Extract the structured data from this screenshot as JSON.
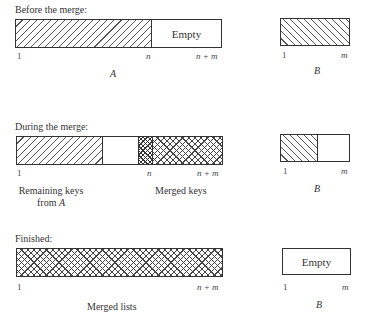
{
  "diagram": {
    "type": "array-merge-illustration",
    "stages": [
      {
        "id": "before",
        "caption": "Before the merge:",
        "array_a": {
          "name": "A",
          "segments": [
            {
              "kind": "keys-of-A",
              "pattern": "forward-hatch",
              "from": "1",
              "to": "n"
            },
            {
              "kind": "empty",
              "label": "Empty",
              "from": "n",
              "to": "n+m"
            }
          ],
          "ticks": {
            "start": "1",
            "mid": "n",
            "end": "n + m"
          }
        },
        "array_b": {
          "name": "B",
          "segments": [
            {
              "kind": "keys-of-B",
              "pattern": "back-hatch",
              "from": "1",
              "to": "m"
            }
          ],
          "ticks": {
            "start": "1",
            "end": "m"
          }
        }
      },
      {
        "id": "during",
        "caption": "During the merge:",
        "array_a": {
          "segments": [
            {
              "kind": "remaining-keys-of-A",
              "pattern": "forward-hatch"
            },
            {
              "kind": "gap",
              "pattern": "none"
            },
            {
              "kind": "merged-keys",
              "pattern": "dense-crosshatch"
            },
            {
              "kind": "merged-keys",
              "pattern": "crosshatch"
            }
          ],
          "ticks": {
            "start": "1",
            "mid": "n",
            "end": "n + m"
          },
          "annotations": {
            "left_line1": "Remaining keys",
            "left_line2_prefix": "from ",
            "left_line2_var": "A",
            "right": "Merged keys"
          }
        },
        "array_b": {
          "name": "B",
          "segments": [
            {
              "kind": "remaining-keys-of-B",
              "pattern": "back-hatch"
            },
            {
              "kind": "empty",
              "pattern": "none"
            }
          ],
          "ticks": {
            "start": "1",
            "end": "m"
          }
        }
      },
      {
        "id": "finished",
        "caption": "Finished:",
        "array_a": {
          "segments": [
            {
              "kind": "merged-lists",
              "pattern": "crosshatch",
              "from": "1",
              "to": "n+m"
            }
          ],
          "ticks": {
            "start": "1",
            "end": "n + m"
          },
          "annotation": "Merged lists"
        },
        "array_b": {
          "name": "B",
          "segments": [
            {
              "kind": "empty",
              "label": "Empty"
            }
          ],
          "ticks": {
            "start": "1",
            "end": "m"
          }
        }
      }
    ]
  },
  "colors": {
    "line": "#333333",
    "hatch": "#555555",
    "background": "#ffffff"
  }
}
